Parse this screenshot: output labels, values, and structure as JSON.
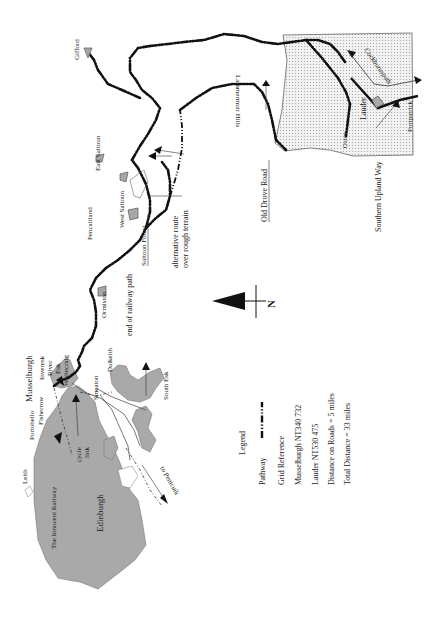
{
  "map": {
    "places": {
      "leith": "Leith",
      "portobello": "Portobello",
      "fisherrow": "Fisherrow",
      "musselburgh": "Musselburgh",
      "inveresk": "Inveresk",
      "river_esk_1": "River",
      "river_esk_2": "Esk",
      "whitecraig": "Whitecraig",
      "smeaton": "Smeaton",
      "dalkeith": "Dalkeith",
      "south_esk": "South Esk",
      "edinburgh": "Edinburgh",
      "cycle_link_1": "cycle",
      "cycle_link_2": "link",
      "innocent_railway": "The Innocent Railway",
      "to_penicuik": "to Penicuik",
      "ormiston": "Ormiston",
      "pencaitland": "Pencaitland",
      "west_saltoun": "West Saltoun",
      "east_saltoun": "East Saltoun",
      "saltoun_forest": "Saltoun Forest",
      "gifford": "Gifford",
      "lammermuir_hills": "Lammermuir Hills",
      "oxton": "Oxton",
      "lauder": "Lauder",
      "cockburnspath": "Cockburnspath",
      "portpatrick": "Portpatrick"
    },
    "annotations": {
      "end_of_railway_path": "end of railway path",
      "alternative_route_1": "alternative route",
      "alternative_route_2": "over rough terrain",
      "old_drove_road": "Old Drove Road",
      "southern_upland_way": "Southern Upland Way"
    },
    "north_arrow": {
      "label": "N",
      "icon": "north-arrow-icon"
    },
    "legend": {
      "title": "Legend",
      "pathway_label": "Pathway",
      "grid_reference_title": "Grid Reference",
      "grid_musselburgh": "Musselburgh NT340 732",
      "grid_lauder": "Lauder NT530 475",
      "distance_roads": "Distance on Roads = 5 miles",
      "total_distance": "Total Distance = 33 miles"
    }
  }
}
